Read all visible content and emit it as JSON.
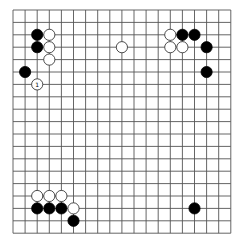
{
  "board": {
    "size": 19,
    "origin_x": 13,
    "origin_y": 10,
    "step_x": 12.1,
    "step_y": 12.4,
    "line_color": "#555555",
    "background": "#ffffff",
    "stone_radius": 5.6
  },
  "stones": [
    {
      "color": "black",
      "col": 2,
      "row": 2
    },
    {
      "color": "black",
      "col": 2,
      "row": 3
    },
    {
      "color": "white",
      "col": 3,
      "row": 2
    },
    {
      "color": "white",
      "col": 3,
      "row": 3
    },
    {
      "color": "white",
      "col": 3,
      "row": 4
    },
    {
      "color": "black",
      "col": 1,
      "row": 5
    },
    {
      "color": "white",
      "col": 2,
      "row": 6,
      "label": "1"
    },
    {
      "color": "white",
      "col": 9,
      "row": 3
    },
    {
      "color": "white",
      "col": 13,
      "row": 2
    },
    {
      "color": "black",
      "col": 14,
      "row": 2
    },
    {
      "color": "black",
      "col": 15,
      "row": 2
    },
    {
      "color": "white",
      "col": 13,
      "row": 3
    },
    {
      "color": "white",
      "col": 14,
      "row": 3
    },
    {
      "color": "black",
      "col": 16,
      "row": 3
    },
    {
      "color": "black",
      "col": 16,
      "row": 5
    },
    {
      "color": "white",
      "col": 2,
      "row": 15
    },
    {
      "color": "white",
      "col": 3,
      "row": 15
    },
    {
      "color": "white",
      "col": 4,
      "row": 15
    },
    {
      "color": "black",
      "col": 2,
      "row": 16
    },
    {
      "color": "black",
      "col": 3,
      "row": 16
    },
    {
      "color": "black",
      "col": 4,
      "row": 16
    },
    {
      "color": "white",
      "col": 5,
      "row": 16
    },
    {
      "color": "black",
      "col": 5,
      "row": 17
    },
    {
      "color": "black",
      "col": 15,
      "row": 16
    }
  ]
}
